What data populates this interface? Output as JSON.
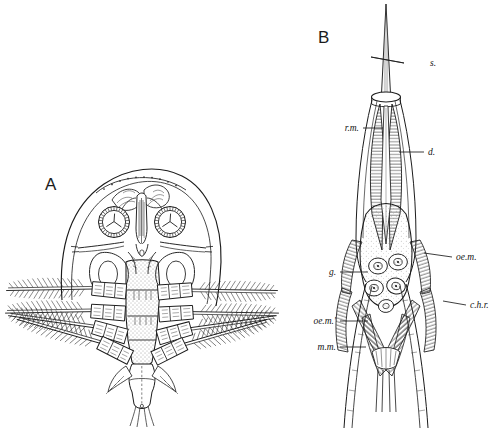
{
  "figure": {
    "background_color": "#ffffff",
    "ink_color": "#1b1b1b",
    "type": "scientific-line-illustration",
    "panels": [
      {
        "letter": "A",
        "name": "dorsal-view-head-thorax",
        "letter_x": 45,
        "letter_y": 190
      },
      {
        "letter": "B",
        "name": "stylet-mouthpart-detail",
        "letter_x": 318,
        "letter_y": 43
      }
    ]
  },
  "labels": [
    {
      "id": "s",
      "text": "s.",
      "side": "right",
      "text_x": 430,
      "text_y": 66,
      "line_x1": 404,
      "line_y1": 63,
      "line_x2": 371,
      "line_y2": 57
    },
    {
      "id": "rm",
      "text": "r.m.",
      "side": "left",
      "text_x": 359,
      "text_y": 131,
      "line_x1": 363,
      "line_y1": 128,
      "line_x2": 383,
      "line_y2": 128
    },
    {
      "id": "d",
      "text": "d.",
      "side": "right",
      "text_x": 428,
      "text_y": 155,
      "line_x1": 424,
      "line_y1": 152,
      "line_x2": 399,
      "line_y2": 152
    },
    {
      "id": "oem",
      "text": "oe.m.",
      "side": "right",
      "text_x": 456,
      "text_y": 260,
      "line_x1": 452,
      "line_y1": 257,
      "line_x2": 424,
      "line_y2": 253
    },
    {
      "id": "g",
      "text": "g.",
      "side": "left",
      "text_x": 336,
      "text_y": 275,
      "line_x1": 340,
      "line_y1": 272,
      "line_x2": 368,
      "line_y2": 272
    },
    {
      "id": "chr",
      "text": "c.h.r.",
      "side": "right",
      "text_x": 470,
      "text_y": 308,
      "line_x1": 466,
      "line_y1": 305,
      "line_x2": 443,
      "line_y2": 301
    },
    {
      "id": "oem2",
      "text": "oe.m.'",
      "side": "left",
      "text_x": 336,
      "text_y": 324,
      "line_x1": 340,
      "line_y1": 321,
      "line_x2": 368,
      "line_y2": 321
    },
    {
      "id": "mm",
      "text": "m.m.",
      "side": "left",
      "text_x": 336,
      "text_y": 350,
      "line_x1": 340,
      "line_y1": 347,
      "line_x2": 366,
      "line_y2": 347
    }
  ]
}
